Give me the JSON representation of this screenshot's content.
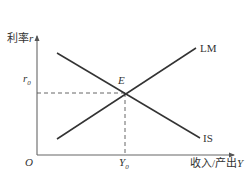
{
  "diagram": {
    "y_axis": {
      "label_cn": "利率",
      "label_var": "r"
    },
    "x_axis": {
      "label_cn": "收入/产出",
      "label_var": "Y"
    },
    "origin": "O",
    "curves": [
      {
        "name": "LM",
        "label": "LM",
        "slope": "upward"
      },
      {
        "name": "IS",
        "label": "IS",
        "slope": "downward"
      }
    ],
    "equilibrium": {
      "point_label": "E",
      "r_label": "r",
      "r_sub": "0",
      "y_label": "Y",
      "y_sub": "0"
    },
    "colors": {
      "line": "#333333",
      "axis": "#555555",
      "dash": "#555555"
    }
  }
}
